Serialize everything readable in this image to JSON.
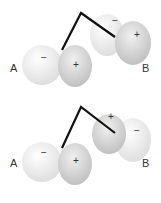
{
  "panels": [
    {
      "id": "top",
      "atom_a": {
        "label": "A",
        "left_lobe_sign": "−",
        "right_lobe_sign": "+"
      },
      "atom_b": {
        "label": "B",
        "back_lobe_sign": "−",
        "front_lobe_sign": "+"
      }
    },
    {
      "id": "bottom",
      "atom_a": {
        "label": "A",
        "left_lobe_sign": "−",
        "right_lobe_sign": "+"
      },
      "atom_b": {
        "label": "B",
        "back_lobe_sign": "+",
        "front_lobe_sign": "−"
      }
    }
  ],
  "colors": {
    "light_lobe": "#f2f2f2",
    "dark_lobe": "#d6d6d6",
    "bond": "#111111"
  }
}
